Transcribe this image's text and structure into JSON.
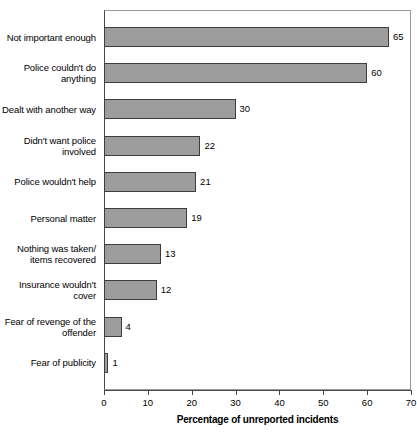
{
  "chart_data": {
    "type": "bar",
    "orientation": "horizontal",
    "title": "",
    "xlabel": "Percentage of unreported incidents",
    "ylabel": "",
    "xlim": [
      0,
      70
    ],
    "xticks": [
      0,
      10,
      20,
      30,
      40,
      50,
      60,
      70
    ],
    "grid": false,
    "legend": null,
    "bar_color": "#9d9d9d",
    "bar_edge_color": "#3d3d3d",
    "categories": [
      "Not important enough",
      "Police couldn't do anything",
      "Dealt with another way",
      "Didn't want police involved",
      "Police wouldn't help",
      "Personal matter",
      "Nothing was taken/ items recovered",
      "Insurance wouldn't cover",
      "Fear of revenge of the offender",
      "Fear of publicity"
    ],
    "values": [
      65,
      60,
      30,
      22,
      21,
      19,
      13,
      12,
      4,
      1
    ],
    "data_labels": [
      "65",
      "60",
      "30",
      "22",
      "21",
      "19",
      "13",
      "12",
      "4",
      "1"
    ],
    "category_lines": [
      [
        "Not important enough"
      ],
      [
        "Police couldn't do",
        "anything"
      ],
      [
        "Dealt with another way"
      ],
      [
        "Didn't want police",
        "involved"
      ],
      [
        "Police wouldn't help"
      ],
      [
        "Personal matter"
      ],
      [
        "Nothing was taken/",
        "items recovered"
      ],
      [
        "Insurance wouldn't",
        "cover"
      ],
      [
        "Fear of revenge of the",
        "offender"
      ],
      [
        "Fear of publicity"
      ]
    ],
    "xtick_labels": [
      "0",
      "10",
      "20",
      "30",
      "40",
      "50",
      "60",
      "70"
    ]
  }
}
